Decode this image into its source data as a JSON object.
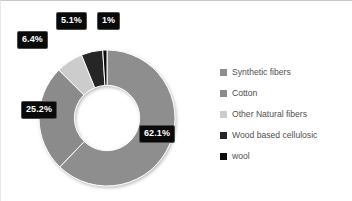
{
  "chart_data": {
    "type": "pie",
    "variant": "donut",
    "title": "",
    "xlabel": "",
    "ylabel": "",
    "unit": "%",
    "legend_position": "right",
    "grid": false,
    "hole_ratio": 0.48,
    "start_angle_deg": 0,
    "direction": "clockwise",
    "categories": [
      "Synthetic fibers",
      "Cotton",
      "Other Natural fibers",
      "Wood based cellulosic",
      "wool"
    ],
    "values": [
      62.1,
      25.2,
      6.4,
      5.1,
      1.0
    ],
    "labels": [
      "62.1%",
      "25.2%",
      "6.4%",
      "5.1%",
      "1%"
    ],
    "colors": [
      "#8e8e8e",
      "#8b8b8b",
      "#cccccc",
      "#252525",
      "#0d0d0d"
    ],
    "slices": [
      {
        "name": "Synthetic fibers",
        "value": 62.1,
        "label": "62.1%",
        "color": "#8e8e8e"
      },
      {
        "name": "Cotton",
        "value": 25.2,
        "label": "25.2%",
        "color": "#8b8b8b"
      },
      {
        "name": "Other Natural fibers",
        "value": 6.4,
        "label": "6.4%",
        "color": "#cccccc"
      },
      {
        "name": "Wood based cellulosic",
        "value": 5.1,
        "label": "5.1%",
        "color": "#252525"
      },
      {
        "name": "wool",
        "value": 1.0,
        "label": "1%",
        "color": "#0d0d0d"
      }
    ]
  },
  "legend": {
    "items": [
      {
        "label": "Synthetic fibers",
        "color": "#8e8e8e"
      },
      {
        "label": "Cotton",
        "color": "#8b8b8b"
      },
      {
        "label": "Other Natural fibers",
        "color": "#cccccc"
      },
      {
        "label": "Wood based cellulosic",
        "color": "#252525"
      },
      {
        "label": "wool",
        "color": "#0d0d0d"
      }
    ]
  },
  "labels": {
    "synthetic": "62.1%",
    "cotton": "25.2%",
    "other_natural": "6.4%",
    "wood_cellulosic": "5.1%",
    "wool": "1%"
  },
  "style": {
    "slice_divider": "#ffffff",
    "label_background": "#0a0a0a",
    "label_text": "#ffffff",
    "legend_text": "#4f4f4f",
    "page_background": "#ffffff"
  }
}
